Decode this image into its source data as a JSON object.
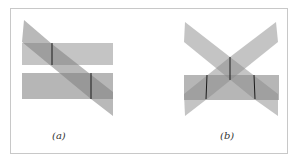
{
  "figure": {
    "panels": [
      {
        "id": "a",
        "label": "(a)",
        "description": "Oblique plane cutting two parallel horizontal planes, each intersection marked by a line"
      },
      {
        "id": "b",
        "label": "(b)",
        "description": "Two crossing oblique planes cutting one horizontal plane, intersection lines marked"
      }
    ],
    "colors": {
      "plane_fill": "#8a8a8a",
      "plane_opacity": 0.55,
      "intersection_line": "#1a1a1a",
      "frame_border": "#c8c8c8",
      "background": "#ffffff"
    }
  }
}
